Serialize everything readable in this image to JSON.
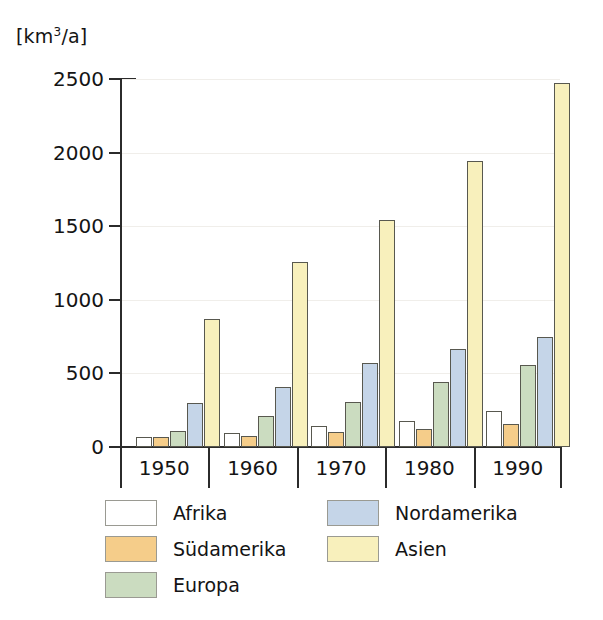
{
  "chart_data": {
    "type": "bar",
    "title": "",
    "subtitle": "",
    "xlabel": "",
    "ylabel": "[km³/a]",
    "ylabel_prefix": "[km",
    "ylabel_sup": "3",
    "ylabel_suffix": "/a]",
    "categories": [
      "1950",
      "1960",
      "1970",
      "1980",
      "1990"
    ],
    "ylim": [
      0,
      2500
    ],
    "yticks": [
      0,
      500,
      1000,
      1500,
      2000,
      2500
    ],
    "ytick_labels": [
      "0",
      "500",
      "1000",
      "1500",
      "2000",
      "2500"
    ],
    "grid": true,
    "grid_axis": "y",
    "legend_position": "bottom",
    "series": [
      {
        "name": "Afrika",
        "color": "#ffffff",
        "values": [
          68,
          95,
          145,
          175,
          245
        ]
      },
      {
        "name": "Südamerika",
        "color": "#f5cd8a",
        "values": [
          70,
          72,
          100,
          125,
          155
        ]
      },
      {
        "name": "Europa",
        "color": "#cbdcc0",
        "values": [
          110,
          210,
          305,
          440,
          560
        ]
      },
      {
        "name": "Nordamerika",
        "color": "#c5d5e8",
        "values": [
          300,
          410,
          570,
          665,
          745
        ]
      },
      {
        "name": "Asien",
        "color": "#f8f0bc",
        "values": [
          870,
          1255,
          1545,
          1945,
          2475
        ]
      }
    ]
  },
  "colors": {
    "axis": "#2b2b2b",
    "bar_outline": "#58584f",
    "gridline": "#f0eeea",
    "text": "#141414",
    "background": "#ffffff"
  }
}
